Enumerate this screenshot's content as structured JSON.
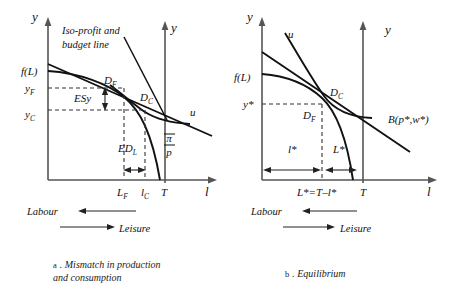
{
  "figure": {
    "panels": [
      {
        "id": "panel-a",
        "caption_key": "a",
        "caption_text": "Mismatch in production",
        "caption_text_line2": "and consumption",
        "axis_y_left_label": "y",
        "axis_y_right_label": "y",
        "axis_x_label": "l",
        "annotations": {
          "isoprofit_line1": "Iso-profit and",
          "isoprofit_line2": "budget line",
          "fL": "f(L)",
          "yF": "y",
          "yF_sub": "F",
          "yC": "y",
          "yC_sub": "C",
          "DF": "D",
          "DF_sub": "F",
          "DC": "D",
          "DC_sub": "C",
          "u": "u",
          "pi_over_p_num": "π",
          "pi_over_p_den": "p",
          "ESy": "ESy",
          "EDL": "ED",
          "EDL_sub": "L",
          "tick_LF": "L",
          "tick_LF_sub": "F",
          "tick_lC": "l",
          "tick_lC_sub": "C",
          "tick_T": "T"
        },
        "direction_labels": {
          "labour": "Labour",
          "leisure": "Leisure"
        }
      },
      {
        "id": "panel-b",
        "caption_key": "b",
        "caption_text": "Equilibrium",
        "caption_text_line2": "",
        "axis_y_left_label": "y",
        "axis_y_right_label": "y",
        "axis_x_label": "l",
        "annotations": {
          "fL": "f(L)",
          "yStar": "y*",
          "DF": "D",
          "DF_sub": "F",
          "DC": "D",
          "DC_sub": "C",
          "u": "u",
          "budget": "B(p*,w*)",
          "lStar": "l*",
          "LStar": "L*",
          "tick_identity": "L*=T–l*",
          "tick_T": "T"
        },
        "direction_labels": {
          "labour": "Labour",
          "leisure": "Leisure"
        }
      }
    ],
    "colors": {
      "axis": "#555555",
      "curve": "#111111",
      "dash": "#333333",
      "text": "#111111",
      "background": "#ffffff"
    }
  }
}
